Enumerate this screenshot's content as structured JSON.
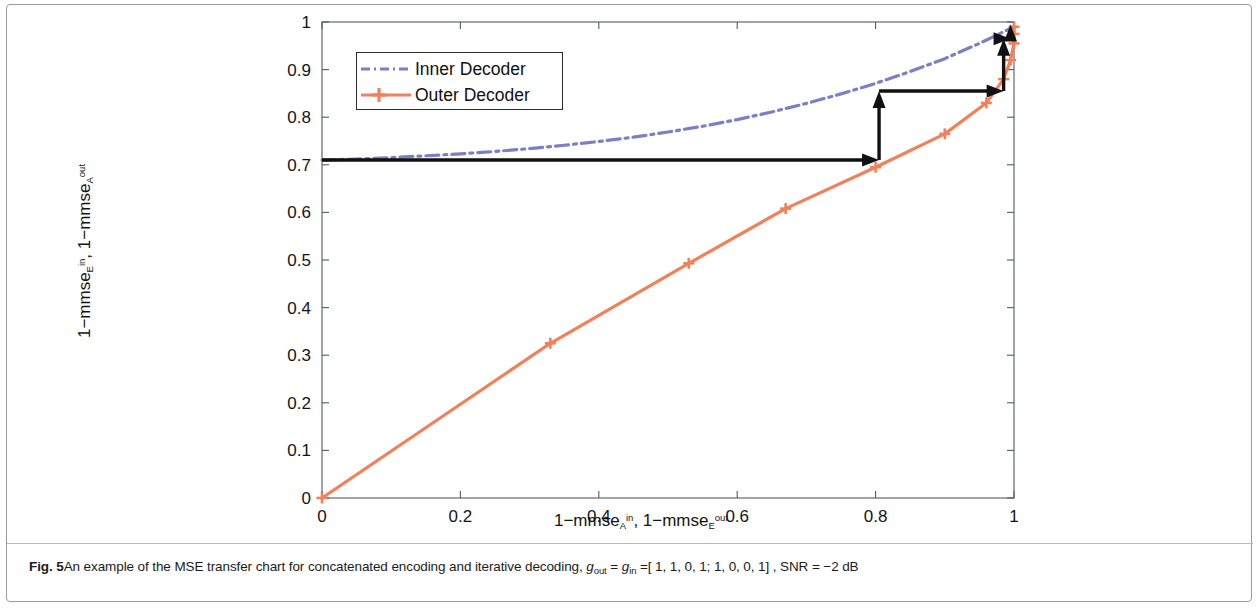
{
  "figure": {
    "label": "Fig. 5",
    "caption_part1": "An example of the MSE transfer chart for concatenated encoding and iterative decoding, ",
    "caption_g_out": "g",
    "caption_g_out_sub": "out",
    "caption_eq1": " = ",
    "caption_g_in": "g",
    "caption_g_in_sub": "in",
    "caption_eq2": " =[ 1, 1, 0, 1; 1, 0, 0, 1] , SNR = −2 dB"
  },
  "axes": {
    "x_title_a": "1−mmse",
    "x_title_a_sub": "A",
    "x_title_a_sup": "in",
    "x_title_sep": ", 1−mmse",
    "x_title_b_sub": "E",
    "x_title_b_sup": "out",
    "y_title_a": "1−mmse",
    "y_title_a_sub": "E",
    "y_title_a_sup": "in",
    "y_title_sep": ", 1−mmse",
    "y_title_b_sub": "A",
    "y_title_b_sup": "out"
  },
  "legend": {
    "position": "top-left-inset",
    "items": [
      {
        "label": "Inner Decoder",
        "color": "#7b7fc4",
        "style": "dash-dot",
        "marker": "none"
      },
      {
        "label": "Outer Decoder",
        "color": "#f2805a",
        "style": "solid",
        "marker": "plus"
      }
    ]
  },
  "chart_data": {
    "type": "line",
    "title": "",
    "xlabel": "1-mmse_A^in, 1-mmse_E^out",
    "ylabel": "1-mmse_E^in, 1-mmse_A^out",
    "xlim": [
      0,
      1
    ],
    "ylim": [
      0,
      1
    ],
    "xticks": [
      0,
      0.2,
      0.4,
      0.6,
      0.8,
      1
    ],
    "xticklabels": [
      "0",
      "0.2",
      "0.4",
      "0.6",
      "0.8",
      "1"
    ],
    "yticks": [
      0,
      0.1,
      0.2,
      0.3,
      0.4,
      0.5,
      0.6,
      0.7,
      0.8,
      0.9,
      1
    ],
    "yticklabels": [
      "0",
      "0.1",
      "0.2",
      "0.3",
      "0.4",
      "0.5",
      "0.6",
      "0.7",
      "0.8",
      "0.9",
      "1"
    ],
    "grid": false,
    "series": [
      {
        "name": "Inner Decoder",
        "color": "#7b7fc4",
        "style": "dash-dot",
        "x": [
          0.0,
          0.05,
          0.1,
          0.15,
          0.2,
          0.25,
          0.3,
          0.35,
          0.4,
          0.45,
          0.5,
          0.55,
          0.6,
          0.65,
          0.7,
          0.75,
          0.8,
          0.85,
          0.9,
          0.95,
          1.0
        ],
        "y": [
          0.71,
          0.712,
          0.715,
          0.719,
          0.723,
          0.728,
          0.734,
          0.741,
          0.749,
          0.758,
          0.769,
          0.781,
          0.795,
          0.811,
          0.829,
          0.849,
          0.871,
          0.896,
          0.923,
          0.955,
          0.99
        ]
      },
      {
        "name": "Outer Decoder",
        "color": "#f2805a",
        "style": "solid",
        "marker": "plus",
        "x": [
          0.0,
          0.33,
          0.53,
          0.67,
          0.8,
          0.9,
          0.96,
          0.985,
          0.995,
          1.0,
          1.0,
          1.0
        ],
        "y": [
          0.0,
          0.325,
          0.493,
          0.608,
          0.695,
          0.765,
          0.83,
          0.88,
          0.92,
          0.955,
          0.975,
          0.99
        ]
      }
    ],
    "annotations": {
      "type": "staircase-trajectory",
      "color": "#111111",
      "description": "Black staircase arrows showing iterative decoding trajectory between the Outer Decoder and Inner Decoder curves",
      "steps": [
        {
          "from": [
            0.0,
            0.71
          ],
          "to": [
            0.805,
            0.71
          ],
          "direction": "right"
        },
        {
          "from": [
            0.805,
            0.71
          ],
          "to": [
            0.805,
            0.855
          ],
          "direction": "up"
        },
        {
          "from": [
            0.805,
            0.855
          ],
          "to": [
            0.985,
            0.855
          ],
          "direction": "right"
        },
        {
          "from": [
            0.985,
            0.855
          ],
          "to": [
            0.985,
            0.965
          ],
          "direction": "up"
        },
        {
          "from": [
            0.985,
            0.965
          ],
          "to": [
            0.995,
            0.965
          ],
          "direction": "right"
        },
        {
          "from": [
            0.995,
            0.965
          ],
          "to": [
            0.995,
            0.995
          ],
          "direction": "up"
        }
      ]
    }
  }
}
